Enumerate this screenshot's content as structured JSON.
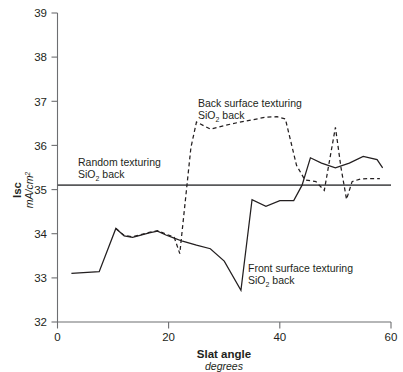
{
  "chart_data": {
    "type": "line",
    "title": "",
    "xlabel": "Slat angle",
    "xlabel_units": "degrees",
    "ylabel": "Isc",
    "ylabel_units": "mA/cm2",
    "xlim": [
      0,
      60
    ],
    "ylim": [
      32,
      39
    ],
    "xticks": [
      0,
      20,
      40,
      60
    ],
    "yticks": [
      32,
      33,
      34,
      35,
      36,
      37,
      38,
      39
    ],
    "grid": false,
    "legend": "none (inline annotations)",
    "series": [
      {
        "name": "Front surface texturing SiO2 back",
        "style": "solid",
        "x": [
          2.5,
          7.5,
          10.5,
          12.0,
          13.5,
          15.0,
          16.5,
          18.0,
          19.5,
          21.0,
          22.5,
          25.0,
          27.5,
          30.0,
          33.0,
          35.0,
          37.5,
          40.0,
          42.5,
          44.0,
          45.5,
          47.5,
          50.0,
          52.5,
          55.0,
          57.5,
          58.5
        ],
        "y": [
          33.1,
          33.14,
          34.12,
          33.95,
          33.92,
          33.97,
          34.02,
          34.06,
          33.97,
          33.9,
          33.83,
          33.74,
          33.66,
          33.38,
          32.72,
          34.77,
          34.62,
          34.75,
          34.75,
          35.1,
          35.72,
          35.6,
          35.49,
          35.6,
          35.75,
          35.68,
          35.49
        ]
      },
      {
        "name": "Back surface texturing SiO2 back",
        "style": "dashed",
        "x": [
          10.5,
          12.0,
          13.5,
          15.0,
          16.5,
          18.0,
          19.5,
          21.0,
          22.0,
          24.0,
          25.0,
          27.5,
          30.0,
          32.5,
          35.0,
          37.5,
          39.5,
          41.0,
          43.0,
          44.5,
          46.5,
          48.0,
          49.0,
          50.0,
          51.0,
          52.0,
          53.0,
          54.5,
          56.0,
          58.0
        ],
        "y": [
          34.12,
          33.96,
          33.93,
          33.98,
          34.03,
          34.07,
          33.99,
          33.92,
          33.55,
          35.95,
          36.53,
          36.37,
          36.45,
          36.52,
          36.58,
          36.64,
          36.65,
          36.6,
          35.55,
          35.22,
          35.18,
          34.98,
          35.7,
          36.41,
          35.5,
          34.78,
          35.18,
          35.24,
          35.25,
          35.25
        ]
      },
      {
        "name": "Random texturing SiO2 back",
        "style": "reference-horizontal",
        "value": 35.1,
        "x": [
          0,
          60
        ],
        "y": [
          35.1,
          35.1
        ]
      }
    ],
    "annotations": [
      {
        "id": "random",
        "line1": "Random texturing",
        "line2_pre": "SiO",
        "line2_sub": "2",
        "line2_post": " back",
        "x_px": 78,
        "y_px": 166
      },
      {
        "id": "back",
        "line1": "Back surface texturing",
        "line2_pre": "SiO",
        "line2_sub": "2",
        "line2_post": " back",
        "x_px": 198,
        "y_px": 107
      },
      {
        "id": "front",
        "line1": "Front surface texturing",
        "line2_pre": "SiO",
        "line2_sub": "2",
        "line2_post": " back",
        "x_px": 248,
        "y_px": 272
      }
    ],
    "colors": {
      "axis": "#6d6e71",
      "reference_line": "#58595b",
      "series_line": "#231f20",
      "background": "#ffffff",
      "text": "#231f20"
    }
  },
  "axes": {
    "y_ticks": [
      {
        "label": "39"
      },
      {
        "label": "38"
      },
      {
        "label": "37"
      },
      {
        "label": "36"
      },
      {
        "label": "35"
      },
      {
        "label": "34"
      },
      {
        "label": "33"
      },
      {
        "label": "32"
      }
    ],
    "x_ticks": [
      {
        "label": "0"
      },
      {
        "label": "20"
      },
      {
        "label": "40"
      },
      {
        "label": "60"
      }
    ]
  }
}
